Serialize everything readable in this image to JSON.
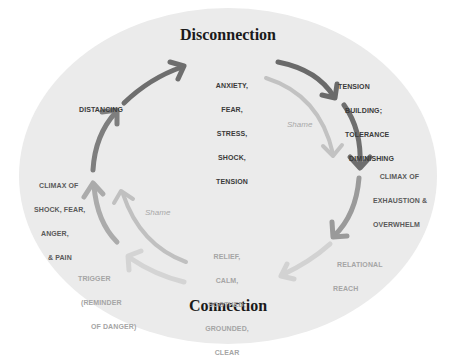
{
  "diagram": {
    "titles": {
      "top": "Disconnection",
      "bottom": "Connection"
    },
    "nodes": [
      {
        "id": "anxiety",
        "lines": [
          "ANXIETY,",
          "FEAR,",
          "STRESS,",
          "SHOCK,",
          "TENSION"
        ]
      },
      {
        "id": "tension-building",
        "lines": [
          "TENSION",
          "BUILDING;",
          "TOLERANCE",
          "DIMINISHING"
        ]
      },
      {
        "id": "climax-exhaustion",
        "lines": [
          "CLIMAX OF",
          "EXHAUSTION &",
          "OVERWHELM"
        ]
      },
      {
        "id": "relational-reach",
        "lines": [
          "RELATIONAL",
          "REACH"
        ]
      },
      {
        "id": "relief",
        "lines": [
          "RELIEF,",
          "CALM,",
          "SOOTHED,",
          "GROUNDED,",
          "CLEAR"
        ]
      },
      {
        "id": "trigger",
        "lines": [
          "TRIGGER",
          "(REMINDER",
          "OF DANGER)"
        ]
      },
      {
        "id": "climax-shock",
        "lines": [
          "CLIMAX OF",
          "SHOCK, FEAR,",
          "ANGER,",
          "& PAIN"
        ]
      },
      {
        "id": "distancing",
        "lines": [
          "DISTANCING"
        ]
      }
    ],
    "shame_labels": [
      "Shame",
      "Shame"
    ],
    "colors": {
      "background_ellipse": "#ebebeb",
      "arrow_dark": "#6e6e6e",
      "arrow_mid": "#8f8f8f",
      "arrow_light": "#c6c6c6",
      "arrow_lightest": "#d4d4d4",
      "title_text": "#1a1a1a"
    }
  }
}
